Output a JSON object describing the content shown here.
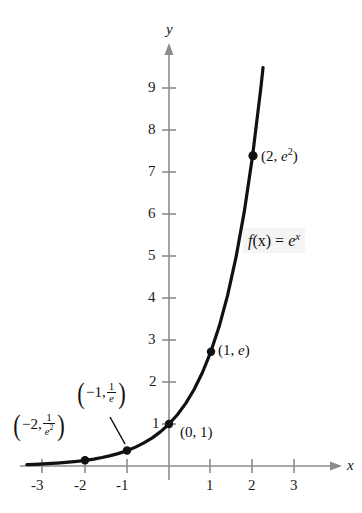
{
  "figure": {
    "background": "#ffffff",
    "axis_color": "#8c8c8c",
    "curve_color": "#111111",
    "point_color": "#111111",
    "function_label_background": "#f4f4f4"
  },
  "axes": {
    "x_axis_name": "x",
    "y_axis_name": "y",
    "x_ticks": [
      "-3",
      "-2",
      "-1",
      "1",
      "2",
      "3"
    ],
    "x_tick_values": [
      -3,
      -2,
      -1,
      1,
      2,
      3
    ],
    "y_ticks": [
      "1",
      "2",
      "3",
      "4",
      "5",
      "6",
      "7",
      "8",
      "9"
    ],
    "y_tick_values": [
      1,
      2,
      3,
      4,
      5,
      6,
      7,
      8,
      9
    ],
    "xlim": [
      -3.45,
      3.9
    ],
    "ylim": [
      -0.55,
      10.0
    ],
    "grid": false
  },
  "labels": {
    "function": {
      "f": "f",
      "of_x": "(x)",
      "equals": " = ",
      "e": "e",
      "exponent": "x",
      "text": "f(x) = e^x"
    },
    "p_minus2": {
      "open": "(",
      "x": "−2,",
      "num": "1",
      "den": "e",
      "den_exp": "2",
      "close": ")",
      "text": "(−2, 1/e²)"
    },
    "p_minus1": {
      "open": "(",
      "x": "−1,",
      "num": "1",
      "den": "e",
      "close": ")",
      "text": "(−1, 1/e)"
    },
    "p_zero": {
      "text": "(0, 1)"
    },
    "p_one": {
      "open": "(1, ",
      "e": "e",
      "close": ")",
      "text": "(1, e)"
    },
    "p_two": {
      "open": "(2, ",
      "e": "e",
      "exponent": "2",
      "close": ")",
      "text": "(2, e²)"
    }
  },
  "chart_data": {
    "type": "line",
    "xlabel": "x",
    "ylabel": "y",
    "xlim": [
      -3.45,
      3.9
    ],
    "ylim": [
      -0.55,
      10.0
    ],
    "grid": false,
    "legend": null,
    "series": [
      {
        "name": "f(x) = e^x",
        "x": [
          -3.4,
          -3.2,
          -3.0,
          -2.8,
          -2.6,
          -2.4,
          -2.2,
          -2.0,
          -1.8,
          -1.6,
          -1.4,
          -1.2,
          -1.0,
          -0.8,
          -0.6,
          -0.4,
          -0.2,
          0.0,
          0.2,
          0.4,
          0.6,
          0.8,
          1.0,
          1.2,
          1.4,
          1.6,
          1.8,
          2.0,
          2.2,
          2.25
        ],
        "y": [
          0.033,
          0.041,
          0.05,
          0.061,
          0.074,
          0.091,
          0.111,
          0.135,
          0.165,
          0.202,
          0.247,
          0.301,
          0.368,
          0.449,
          0.549,
          0.67,
          0.819,
          1.0,
          1.221,
          1.492,
          1.822,
          2.226,
          2.718,
          3.32,
          4.055,
          4.953,
          6.05,
          7.389,
          9.025,
          9.488
        ]
      }
    ],
    "marked_points": [
      {
        "label": "(−2, 1/e²)",
        "x": -2,
        "y": 0.135
      },
      {
        "label": "(−1, 1/e)",
        "x": -1,
        "y": 0.368
      },
      {
        "label": "(0, 1)",
        "x": 0,
        "y": 1
      },
      {
        "label": "(1, e)",
        "x": 1,
        "y": 2.718
      },
      {
        "label": "(2, e²)",
        "x": 2,
        "y": 7.389
      }
    ]
  }
}
